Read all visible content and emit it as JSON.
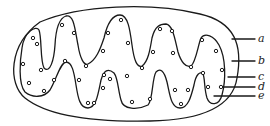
{
  "figure": {
    "stroke_color": "#1a1a1a",
    "background": "#ffffff"
  },
  "labels": [
    {
      "id": "a",
      "text": "a",
      "y": 39,
      "line_x1": 232
    },
    {
      "id": "b",
      "text": "b",
      "y": 61,
      "line_x1": 232
    },
    {
      "id": "c",
      "text": "c",
      "y": 77,
      "line_x1": 228
    },
    {
      "id": "d",
      "text": "d",
      "y": 87,
      "line_x1": 222
    },
    {
      "id": "e",
      "text": "e",
      "y": 96,
      "line_x1": 214
    }
  ],
  "particles": [
    [
      33,
      38
    ],
    [
      37,
      44
    ],
    [
      23,
      64
    ],
    [
      41,
      70
    ],
    [
      29,
      83
    ],
    [
      44,
      91
    ],
    [
      54,
      80
    ],
    [
      62,
      25
    ],
    [
      74,
      33
    ],
    [
      65,
      61
    ],
    [
      79,
      80
    ],
    [
      86,
      66
    ],
    [
      103,
      88
    ],
    [
      110,
      79
    ],
    [
      121,
      20
    ],
    [
      108,
      33
    ],
    [
      103,
      51
    ],
    [
      128,
      43
    ],
    [
      88,
      103
    ],
    [
      94,
      103
    ],
    [
      104,
      75
    ],
    [
      127,
      76
    ],
    [
      142,
      68
    ],
    [
      132,
      102
    ],
    [
      150,
      99
    ],
    [
      160,
      29
    ],
    [
      172,
      31
    ],
    [
      153,
      52
    ],
    [
      173,
      53
    ],
    [
      191,
      67
    ],
    [
      175,
      90
    ],
    [
      188,
      90
    ],
    [
      181,
      104
    ],
    [
      202,
      40
    ],
    [
      216,
      51
    ],
    [
      222,
      70
    ],
    [
      203,
      73
    ],
    [
      208,
      87
    ],
    [
      221,
      87
    ]
  ]
}
